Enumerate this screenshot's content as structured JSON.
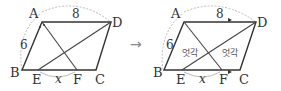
{
  "figure_left": {
    "vertices": {
      "A": "A",
      "B": "B",
      "C": "C",
      "D": "D",
      "E": "E",
      "F": "F"
    },
    "length_top": "8",
    "length_left": "6",
    "length_ef": "x"
  },
  "arrow": "→",
  "figure_right": {
    "vertices": {
      "A": "A",
      "B": "B",
      "C": "C",
      "D": "D",
      "E": "E",
      "F": "F"
    },
    "length_top": "8",
    "length_left": "6",
    "length_ef": "x",
    "alt_angle_left": "엇각",
    "alt_angle_right": "엇각"
  }
}
